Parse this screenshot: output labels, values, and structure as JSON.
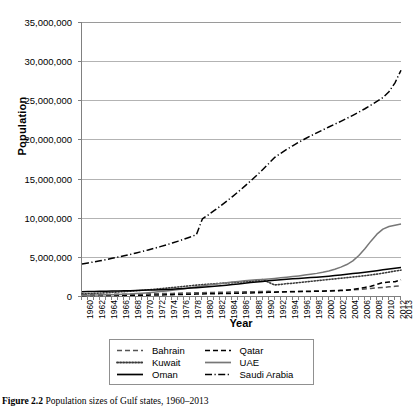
{
  "chart_data": {
    "type": "line",
    "title": "",
    "xlabel": "Year",
    "ylabel": "Population",
    "xlim": [
      1960,
      2013
    ],
    "ylim": [
      0,
      35000000
    ],
    "grid": true,
    "legend_position": "bottom",
    "ytick_labels": [
      "0",
      "5,000,000",
      "10,000,000",
      "15,000,000",
      "20,000,000",
      "25,000,000",
      "30,000,000",
      "35,000,000"
    ],
    "ytick_values": [
      0,
      5000000,
      10000000,
      15000000,
      20000000,
      25000000,
      30000000,
      35000000
    ],
    "xtick_labels": [
      "1960",
      "1962",
      "1964",
      "1966",
      "1968",
      "1970",
      "1972",
      "1974",
      "1976",
      "1978",
      "1980",
      "1982",
      "1984",
      "1986",
      "1988",
      "1990",
      "1992",
      "1994",
      "1996",
      "1998",
      "2000",
      "2002",
      "2004",
      "2006",
      "2008",
      "2010",
      "2012",
      "2013"
    ],
    "x": [
      1960,
      1961,
      1962,
      1963,
      1964,
      1965,
      1966,
      1967,
      1968,
      1969,
      1970,
      1971,
      1972,
      1973,
      1974,
      1975,
      1976,
      1977,
      1978,
      1979,
      1980,
      1981,
      1982,
      1983,
      1984,
      1985,
      1986,
      1987,
      1988,
      1989,
      1990,
      1991,
      1992,
      1993,
      1994,
      1995,
      1996,
      1997,
      1998,
      1999,
      2000,
      2001,
      2002,
      2003,
      2004,
      2005,
      2006,
      2007,
      2008,
      2009,
      2010,
      2011,
      2012,
      2013
    ],
    "series": [
      {
        "name": "Bahrain",
        "style": "dashed",
        "color": "#555555",
        "values": [
          162000,
          171000,
          180000,
          189000,
          198000,
          208000,
          218000,
          228000,
          238000,
          249000,
          260000,
          272000,
          285000,
          300000,
          316000,
          334000,
          353000,
          372000,
          391000,
          410000,
          429000,
          447000,
          463000,
          477000,
          490000,
          503000,
          516000,
          529000,
          543000,
          558000,
          576000,
          596000,
          519000,
          536000,
          552000,
          568000,
          583000,
          598000,
          614000,
          631000,
          650000,
          672000,
          696000,
          724000,
          757000,
          797000,
          845000,
          901000,
          964000,
          1031000,
          1099000,
          1168000,
          1235000,
          1295000
        ]
      },
      {
        "name": "Qatar",
        "style": "dashed",
        "color": "#000000",
        "values": [
          47000,
          50000,
          54000,
          58000,
          62000,
          67000,
          72000,
          78000,
          84000,
          90000,
          98000,
          108000,
          119000,
          133000,
          149000,
          167000,
          186000,
          206000,
          226000,
          245000,
          262000,
          278000,
          293000,
          307000,
          321000,
          336000,
          352000,
          371000,
          392000,
          415000,
          439000,
          465000,
          490000,
          513000,
          532000,
          549000,
          563000,
          575000,
          587000,
          600000,
          616000,
          636000,
          659000,
          689000,
          730000,
          825000,
          962000,
          1100000,
          1250000,
          1480000,
          1715000,
          1780000,
          1830000,
          2070000
        ]
      },
      {
        "name": "Kuwait",
        "style": "dotted",
        "color": "#3a3a3a",
        "values": [
          269000,
          300000,
          336000,
          375000,
          417000,
          462000,
          510000,
          562000,
          616000,
          673000,
          733000,
          796000,
          862000,
          931000,
          1003000,
          1077000,
          1154000,
          1232000,
          1309000,
          1383000,
          1450000,
          1510000,
          1564000,
          1613000,
          1661000,
          1710000,
          1762000,
          1817000,
          1876000,
          1936000,
          2088000,
          1741000,
          1418000,
          1476000,
          1576000,
          1628000,
          1709000,
          1790000,
          1871000,
          1952000,
          2033000,
          2112000,
          2190000,
          2268000,
          2345000,
          2424000,
          2507000,
          2595000,
          2691000,
          2798000,
          2918000,
          3050000,
          3190000,
          3300000
        ]
      },
      {
        "name": "UAE",
        "style": "solid",
        "color": "#777777",
        "values": [
          92000,
          104000,
          118000,
          134000,
          152000,
          174000,
          200000,
          231000,
          268000,
          312000,
          363000,
          421000,
          487000,
          561000,
          643000,
          733000,
          832000,
          940000,
          1054000,
          1170000,
          1286000,
          1399000,
          1507000,
          1609000,
          1703000,
          1788000,
          1865000,
          1935000,
          1999000,
          2060000,
          2120000,
          2182000,
          2247000,
          2317000,
          2394000,
          2477000,
          2568000,
          2668000,
          2775000,
          2889000,
          3026000,
          3200000,
          3421000,
          3693000,
          4016000,
          4481000,
          5171000,
          6039000,
          7007000,
          7900000,
          8550000,
          8870000,
          9040000,
          9200000
        ]
      },
      {
        "name": "Oman",
        "style": "solid",
        "color": "#000000",
        "values": [
          558000,
          570000,
          583000,
          597000,
          612000,
          628000,
          645000,
          663000,
          683000,
          704000,
          727000,
          752000,
          779000,
          809000,
          842000,
          877000,
          916000,
          959000,
          1006000,
          1057000,
          1113000,
          1174000,
          1240000,
          1311000,
          1386000,
          1465000,
          1546000,
          1628000,
          1710000,
          1790000,
          1868000,
          1942000,
          2012000,
          2077000,
          2137000,
          2193000,
          2246000,
          2299000,
          2353000,
          2410000,
          2471000,
          2538000,
          2611000,
          2690000,
          2774000,
          2862000,
          2952000,
          3045000,
          3141000,
          3240000,
          3342000,
          3447000,
          3555000,
          3630000
        ]
      },
      {
        "name": "Saudi Arabia",
        "style": "dashdot",
        "color": "#000000",
        "values": [
          4086000,
          4220000,
          4359000,
          4503000,
          4653000,
          4808000,
          4970000,
          5138000,
          5313000,
          5495000,
          5685000,
          5883000,
          6089000,
          6305000,
          6530000,
          6766000,
          7013000,
          7272000,
          7544000,
          7828000,
          9844000,
          10376000,
          10927000,
          11498000,
          12089000,
          12702000,
          13338000,
          13998000,
          14683000,
          15394000,
          16133000,
          16900000,
          17696000,
          18222000,
          18719000,
          19189000,
          19633000,
          20054000,
          20455000,
          20840000,
          21214000,
          21581000,
          21946000,
          22314000,
          22691000,
          23081000,
          23490000,
          23921000,
          24378000,
          24858000,
          25357000,
          26090000,
          27230000,
          28830000
        ]
      }
    ]
  },
  "caption": {
    "prefix": "Figure 2.2",
    "text": "Population sizes of Gulf states, 1960–2013"
  }
}
